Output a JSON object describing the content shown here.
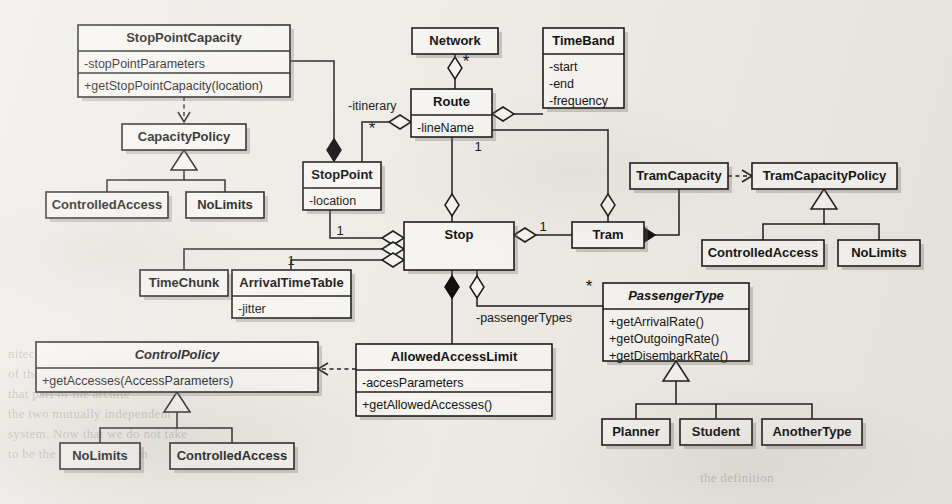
{
  "diagram": {
    "kind": "uml-class-diagram",
    "background_color": "#eeebe6",
    "line_color": "#1c1c1c",
    "box_fill": "#f6f4f0"
  },
  "classes": [
    {
      "id": "stoppointcapacity",
      "name": "StopPointCapacity",
      "abstract": false,
      "attributes": [
        "-stopPointParameters"
      ],
      "operations": [
        "+getStopPointCapacity(location)"
      ],
      "x": 78,
      "y": 25,
      "w": 212,
      "h": 72
    },
    {
      "id": "capacitypolicy",
      "name": "CapacityPolicy",
      "abstract": false,
      "attributes": [],
      "operations": [],
      "x": 122,
      "y": 124,
      "w": 124,
      "h": 26
    },
    {
      "id": "controlledaccess_cap",
      "name": "ControlledAccess",
      "abstract": false,
      "attributes": [],
      "operations": [],
      "x": 46,
      "y": 192,
      "w": 122,
      "h": 26
    },
    {
      "id": "nolimits_cap",
      "name": "NoLimits",
      "abstract": false,
      "attributes": [],
      "operations": [],
      "x": 186,
      "y": 192,
      "w": 78,
      "h": 26
    },
    {
      "id": "network",
      "name": "Network",
      "abstract": false,
      "attributes": [],
      "operations": [],
      "x": 412,
      "y": 28,
      "w": 86,
      "h": 26
    },
    {
      "id": "timeband",
      "name": "TimeBand",
      "abstract": false,
      "attributes": [
        "-start",
        "-end",
        "-frequency"
      ],
      "operations": [],
      "x": 543,
      "y": 28,
      "w": 81,
      "h": 80
    },
    {
      "id": "route",
      "name": "Route",
      "abstract": false,
      "attributes": [
        "-lineName"
      ],
      "operations": [],
      "x": 411,
      "y": 89,
      "w": 81,
      "h": 48
    },
    {
      "id": "stoppoint",
      "name": "StopPoint",
      "abstract": false,
      "attributes": [
        "-location"
      ],
      "operations": [],
      "x": 303,
      "y": 162,
      "w": 78,
      "h": 48
    },
    {
      "id": "stop",
      "name": "Stop",
      "abstract": false,
      "attributes": [],
      "operations": [],
      "x": 404,
      "y": 222,
      "w": 110,
      "h": 48
    },
    {
      "id": "tram",
      "name": "Tram",
      "abstract": false,
      "attributes": [],
      "operations": [],
      "x": 572,
      "y": 222,
      "w": 72,
      "h": 26
    },
    {
      "id": "tramcapacity",
      "name": "TramCapacity",
      "abstract": false,
      "attributes": [],
      "operations": [],
      "x": 630,
      "y": 163,
      "w": 98,
      "h": 26
    },
    {
      "id": "tramcapacitypolicy",
      "name": "TramCapacityPolicy",
      "abstract": false,
      "attributes": [],
      "operations": [],
      "x": 752,
      "y": 163,
      "w": 145,
      "h": 26
    },
    {
      "id": "controlledaccess_tram",
      "name": "ControlledAccess",
      "abstract": false,
      "attributes": [],
      "operations": [],
      "x": 702,
      "y": 240,
      "w": 122,
      "h": 26
    },
    {
      "id": "nolimits_tram",
      "name": "NoLimits",
      "abstract": false,
      "attributes": [],
      "operations": [],
      "x": 838,
      "y": 240,
      "w": 82,
      "h": 26
    },
    {
      "id": "timechunk",
      "name": "TimeChunk",
      "abstract": false,
      "attributes": [],
      "operations": [],
      "x": 140,
      "y": 270,
      "w": 88,
      "h": 26
    },
    {
      "id": "arrivaltimetable",
      "name": "ArrivalTimeTable",
      "abstract": false,
      "attributes": [
        "-jitter"
      ],
      "operations": [],
      "x": 232,
      "y": 270,
      "w": 119,
      "h": 48
    },
    {
      "id": "passengertype",
      "name": "PassengerType",
      "abstract": true,
      "attributes": [],
      "operations": [
        "+getArrivalRate()",
        "+getOutgoingRate()",
        "+getDisembarkRate()"
      ],
      "x": 603,
      "y": 283,
      "w": 146,
      "h": 78
    },
    {
      "id": "controlpolicy",
      "name": "ControlPolicy",
      "abstract": true,
      "attributes": [],
      "operations": [
        "+getAccesses(AccessParameters)"
      ],
      "x": 36,
      "y": 342,
      "w": 282,
      "h": 50
    },
    {
      "id": "allowedaccesslimit",
      "name": "AllowedAccessLimit",
      "abstract": false,
      "attributes": [
        "-accesParameters"
      ],
      "operations": [
        "+getAllowedAccesses()"
      ],
      "x": 356,
      "y": 344,
      "w": 196,
      "h": 72
    },
    {
      "id": "nolimits_ctrl",
      "name": "NoLimits",
      "abstract": false,
      "attributes": [],
      "operations": [],
      "x": 60,
      "y": 443,
      "w": 80,
      "h": 26
    },
    {
      "id": "controlledaccess_ctrl",
      "name": "ControlledAccess",
      "abstract": false,
      "attributes": [],
      "operations": [],
      "x": 170,
      "y": 443,
      "w": 124,
      "h": 26
    },
    {
      "id": "planner",
      "name": "Planner",
      "abstract": false,
      "attributes": [],
      "operations": [],
      "x": 602,
      "y": 419,
      "w": 68,
      "h": 26
    },
    {
      "id": "student",
      "name": "Student",
      "abstract": false,
      "attributes": [],
      "operations": [],
      "x": 680,
      "y": 419,
      "w": 72,
      "h": 26
    },
    {
      "id": "anothertype",
      "name": "AnotherType",
      "abstract": false,
      "attributes": [],
      "operations": [],
      "x": 762,
      "y": 419,
      "w": 100,
      "h": 26
    }
  ],
  "edge_labels": [
    {
      "id": "lbl-itinerary",
      "text": "-itinerary",
      "x": 348,
      "y": 107,
      "anchor": "start"
    },
    {
      "id": "lbl-passengertypes",
      "text": "-passengerTypes",
      "x": 476,
      "y": 319,
      "anchor": "start"
    }
  ],
  "multiplicities": [
    {
      "id": "mult-network-route",
      "text": "*",
      "x": 466,
      "y": 63,
      "kind": "star"
    },
    {
      "id": "mult-route-itinerary",
      "text": "*",
      "x": 372,
      "y": 130,
      "kind": "star"
    },
    {
      "id": "mult-route-stop",
      "text": "1",
      "x": 478,
      "y": 148,
      "kind": "one"
    },
    {
      "id": "mult-stoppoint-stop",
      "text": "1",
      "x": 340,
      "y": 232,
      "kind": "one"
    },
    {
      "id": "mult-arrivaltimetable-stop",
      "text": "1",
      "x": 291,
      "y": 262,
      "kind": "one"
    },
    {
      "id": "mult-stop-tram",
      "text": "1",
      "x": 543,
      "y": 228,
      "kind": "one"
    },
    {
      "id": "mult-stop-passengertype",
      "text": "*",
      "x": 589,
      "y": 288,
      "kind": "star"
    }
  ],
  "relationships": [
    {
      "id": "rel-stoppointcapacity-capacitypolicy",
      "type": "dependency",
      "from": "stoppointcapacity",
      "to": "capacitypolicy"
    },
    {
      "id": "rel-capacitypolicy-controlledaccess",
      "type": "generalization",
      "from": "controlledaccess_cap",
      "to": "capacitypolicy"
    },
    {
      "id": "rel-capacitypolicy-nolimits",
      "type": "generalization",
      "from": "nolimits_cap",
      "to": "capacitypolicy"
    },
    {
      "id": "rel-stoppointcapacity-stoppoint",
      "type": "composition",
      "from": "stoppointcapacity",
      "to": "stoppoint"
    },
    {
      "id": "rel-network-route",
      "type": "aggregation",
      "from": "route",
      "to": "network"
    },
    {
      "id": "rel-route-timeband",
      "type": "aggregation",
      "from": "route",
      "to": "timeband"
    },
    {
      "id": "rel-route-stoppoint",
      "type": "aggregation",
      "from": "route",
      "to": "stoppoint"
    },
    {
      "id": "rel-route-stop",
      "type": "aggregation",
      "from": "route",
      "to": "stop"
    },
    {
      "id": "rel-stoppoint-stop",
      "type": "aggregation",
      "from": "stoppoint",
      "to": "stop"
    },
    {
      "id": "rel-timechunk-stop",
      "type": "aggregation",
      "from": "timechunk",
      "to": "stop"
    },
    {
      "id": "rel-arrivaltimetable-stop",
      "type": "aggregation",
      "from": "arrivaltimetable",
      "to": "stop"
    },
    {
      "id": "rel-stop-tram",
      "type": "aggregation",
      "from": "stop",
      "to": "tram"
    },
    {
      "id": "rel-route-tram",
      "type": "aggregation",
      "from": "route",
      "to": "tram"
    },
    {
      "id": "rel-tram-tramcapacity",
      "type": "composition",
      "from": "tram",
      "to": "tramcapacity"
    },
    {
      "id": "rel-tramcapacity-tramcapacitypolicy",
      "type": "dependency",
      "from": "tramcapacity",
      "to": "tramcapacitypolicy"
    },
    {
      "id": "rel-tramcapacitypolicy-controlledaccess",
      "type": "generalization",
      "from": "controlledaccess_tram",
      "to": "tramcapacitypolicy"
    },
    {
      "id": "rel-tramcapacitypolicy-nolimits",
      "type": "generalization",
      "from": "nolimits_tram",
      "to": "tramcapacitypolicy"
    },
    {
      "id": "rel-stop-allowedaccesslimit",
      "type": "composition",
      "from": "stop",
      "to": "allowedaccesslimit"
    },
    {
      "id": "rel-stop-passengertype",
      "type": "aggregation",
      "from": "stop",
      "to": "passengertype"
    },
    {
      "id": "rel-allowedaccesslimit-controlpolicy",
      "type": "dependency",
      "from": "allowedaccesslimit",
      "to": "controlpolicy"
    },
    {
      "id": "rel-controlpolicy-nolimits",
      "type": "generalization",
      "from": "nolimits_ctrl",
      "to": "controlpolicy"
    },
    {
      "id": "rel-controlpolicy-controlledaccess",
      "type": "generalization",
      "from": "controlledaccess_ctrl",
      "to": "controlpolicy"
    },
    {
      "id": "rel-passengertype-planner",
      "type": "generalization",
      "from": "planner",
      "to": "passengertype"
    },
    {
      "id": "rel-passengertype-student",
      "type": "generalization",
      "from": "student",
      "to": "passengertype"
    },
    {
      "id": "rel-passengertype-anothertype",
      "type": "generalization",
      "from": "anothertype",
      "to": "passengertype"
    }
  ],
  "background_bleed": [
    {
      "text": "nitecture, the principle",
      "x": 8,
      "y": 346
    },
    {
      "text": "of the oo and compo",
      "x": 8,
      "y": 366
    },
    {
      "text": "that part of the archite",
      "x": 8,
      "y": 386
    },
    {
      "text": "the two mutually independent",
      "x": 8,
      "y": 406
    },
    {
      "text": "system. Now that we do not take",
      "x": 8,
      "y": 426
    },
    {
      "text": "to be the case in a system",
      "x": 8,
      "y": 446
    },
    {
      "text": "the definition",
      "x": 700,
      "y": 470
    }
  ]
}
